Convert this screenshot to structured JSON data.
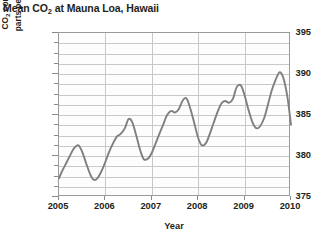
{
  "chart_data": {
    "type": "line",
    "title": "Mean CO2 at Mauna Loa, Hawaii",
    "title_main": "Mean CO",
    "title_sub": "2",
    "title_rest": " at Mauna Loa, Hawaii",
    "xlabel": "Year",
    "ylabel": "CO2 concentration in parts per million (ppm)",
    "ylabel_line1_main": "CO",
    "ylabel_line1_sub": "2",
    "ylabel_line1_rest": " concentration in",
    "ylabel_line2_main": "parts per million",
    "ylabel_line2_unit": " (ppm)",
    "xlim": [
      2005,
      2010
    ],
    "ylim": [
      375,
      395
    ],
    "ytick_labels": [
      "395",
      "390",
      "385",
      "380",
      "375"
    ],
    "ytick_values": [
      395,
      390,
      385,
      380,
      375
    ],
    "yminor_step": 1.25,
    "xtick_labels": [
      "2005",
      "2006",
      "2007",
      "2008",
      "2009",
      "2010"
    ],
    "xtick_values": [
      2005,
      2006,
      2007,
      2008,
      2009,
      2010
    ],
    "grid": "horizontal-and-vertical",
    "legend": "none",
    "line_color": "#7f7f7f",
    "grid_color": "#c9c9c9",
    "frame_color": "#9a9a9a",
    "series": [
      {
        "name": "Mean CO2 concentration",
        "x": [
          2005.0,
          2005.08,
          2005.17,
          2005.25,
          2005.33,
          2005.42,
          2005.5,
          2005.58,
          2005.67,
          2005.75,
          2005.83,
          2005.92,
          2006.0,
          2006.08,
          2006.17,
          2006.25,
          2006.33,
          2006.42,
          2006.5,
          2006.58,
          2006.67,
          2006.75,
          2006.83,
          2006.92,
          2007.0,
          2007.08,
          2007.17,
          2007.25,
          2007.33,
          2007.42,
          2007.5,
          2007.58,
          2007.67,
          2007.75,
          2007.83,
          2007.92,
          2008.0,
          2008.08,
          2008.17,
          2008.25,
          2008.33,
          2008.42,
          2008.5,
          2008.58,
          2008.67,
          2008.75,
          2008.83,
          2008.92,
          2009.0,
          2009.08,
          2009.17,
          2009.25,
          2009.33,
          2009.42,
          2009.5,
          2009.58,
          2009.67,
          2009.75,
          2009.83,
          2009.92,
          2010.0
        ],
        "y": [
          377.3,
          378.3,
          379.3,
          380.2,
          381.0,
          381.3,
          380.5,
          379.2,
          377.8,
          377.1,
          377.3,
          378.2,
          379.3,
          380.5,
          381.6,
          382.4,
          382.7,
          383.4,
          384.5,
          384.1,
          382.4,
          380.7,
          379.6,
          379.7,
          380.4,
          381.5,
          382.8,
          383.9,
          385.0,
          385.5,
          385.3,
          385.7,
          386.8,
          387.0,
          385.8,
          383.9,
          382.2,
          381.3,
          381.6,
          382.7,
          384.0,
          385.4,
          386.4,
          386.7,
          386.5,
          387.0,
          388.4,
          388.6,
          387.4,
          385.7,
          384.1,
          383.4,
          383.6,
          384.6,
          386.2,
          387.9,
          389.3,
          390.2,
          389.6,
          387.3,
          383.8
        ]
      }
    ]
  }
}
